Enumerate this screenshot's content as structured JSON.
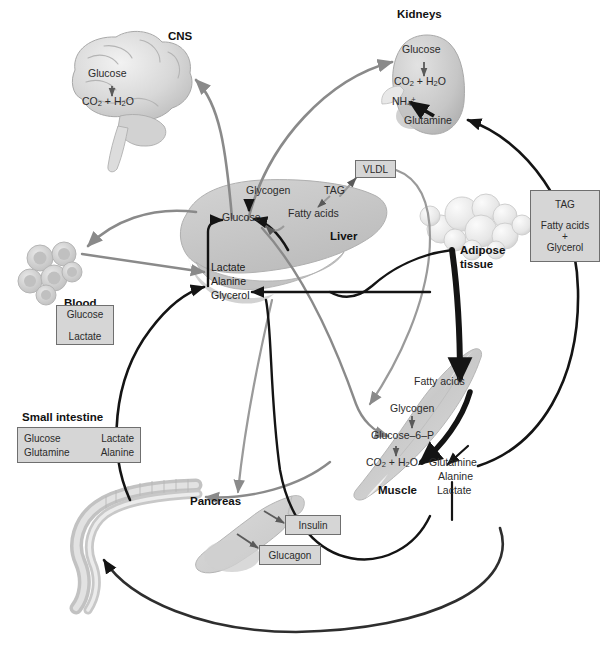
{
  "figure": {
    "type": "biological-pathway-diagram"
  },
  "organs": {
    "cns": {
      "label": "CNS",
      "molecules": [
        "Glucose",
        "CO2 + H2O"
      ]
    },
    "kidneys": {
      "label": "Kidneys",
      "molecules": [
        "Glucose",
        "CO2 + H2O",
        "NH4+",
        "Glutamine"
      ]
    },
    "liver": {
      "label": "Liver",
      "molecules": [
        "Glycogen",
        "Glucose",
        "TAG",
        "Fatty acids",
        "Lactate",
        "Alanine",
        "Glycerol"
      ],
      "vldl_label": "VLDL"
    },
    "blood": {
      "label": "Blood",
      "box": [
        "Glucose",
        "Lactate"
      ]
    },
    "small_intestine": {
      "label": "Small intestine",
      "box_rows": [
        {
          "from": "Glucose",
          "to": "Lactate"
        },
        {
          "from": "Glutamine",
          "to": "Alanine"
        }
      ]
    },
    "pancreas": {
      "label": "Pancreas",
      "hormones": [
        "Insulin",
        "Glucagon"
      ]
    },
    "adipose": {
      "label_line1": "Adipose",
      "label_line2": "tissue",
      "box": [
        "TAG",
        "Fatty acids",
        "+",
        "Glycerol"
      ]
    },
    "muscle": {
      "label": "Muscle",
      "molecules": [
        "Fatty acids",
        "Glycogen",
        "Glucose–6–P",
        "CO2 + H2O"
      ],
      "outputs": [
        "Glutamine",
        "Alanine",
        "Lactate"
      ]
    }
  },
  "colors": {
    "arrow_gray": "#8a8a8a",
    "arrow_black": "#141414",
    "organ_fill": "#c9c9c9",
    "box_fill": "#d6d6d6",
    "box_border": "#6f6f6f"
  }
}
